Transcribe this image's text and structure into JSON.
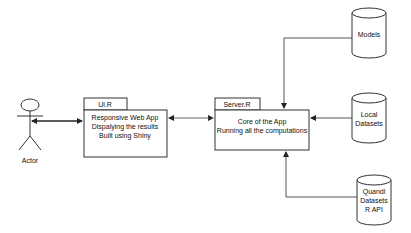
{
  "actor": {
    "label": "Actor"
  },
  "ui_box": {
    "tab_label": "Ul.R",
    "lines": [
      "Responsive Web App",
      "Dispalying the results",
      "Built using Shiny"
    ]
  },
  "server_box": {
    "tab_label": "Server.R",
    "lines": [
      "Core of the App",
      "Running all the computations"
    ]
  },
  "datastores": [
    {
      "lines": [
        "Models"
      ]
    },
    {
      "lines": [
        "Local",
        "Datasets"
      ]
    },
    {
      "lines": [
        "Quandl",
        "Datasets",
        "R API"
      ]
    }
  ],
  "colors": {
    "stroke": "#333333",
    "line": "#555555",
    "background": "#ffffff"
  }
}
